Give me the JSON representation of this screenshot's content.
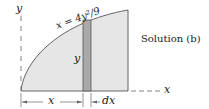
{
  "figure": {
    "equation": "x = 4y²/9",
    "caption": "Solution (b)",
    "axis_labels": {
      "y_axis": "y",
      "x_axis": "x"
    },
    "strip_label_height": "y",
    "dimension_labels": {
      "x": "x",
      "dx": "dx"
    },
    "colors": {
      "region_fill": "#e6e6e6",
      "strip_fill": "#a9a9a9",
      "line": "#555555",
      "text": "#222222"
    }
  }
}
